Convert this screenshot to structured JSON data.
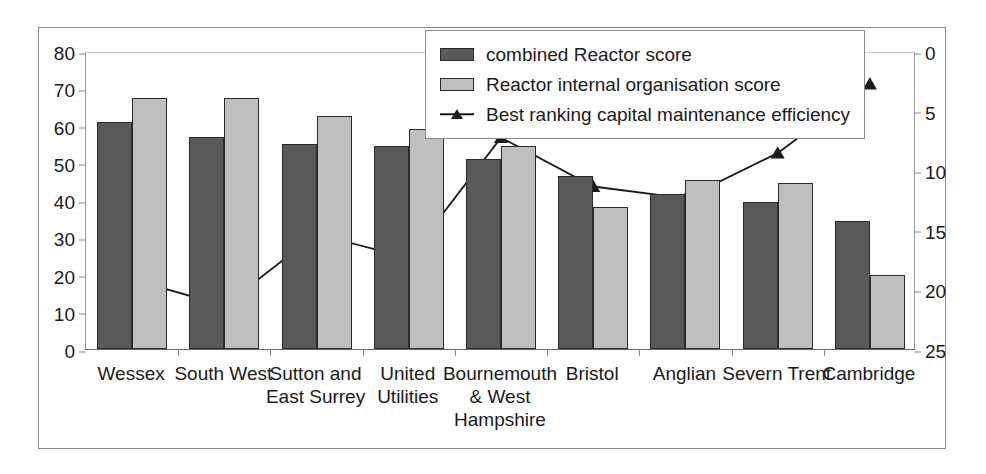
{
  "chart_data": {
    "type": "bar",
    "title": "",
    "subtitle": "",
    "xlabel": "",
    "ylabel": "",
    "categories": [
      "Wessex",
      "South West",
      "Sutton and\nEast Surrey",
      "United\nUtilities",
      "Bournemouth\n& West\nHampshire",
      "Bristol",
      "Anglian",
      "Severn Trent",
      "Cambridge"
    ],
    "series": [
      {
        "name": "combined Reactor score",
        "type": "bar",
        "axis": "left",
        "color": "#595959",
        "values": [
          61,
          57,
          55,
          54.5,
          51,
          46.5,
          41.5,
          39.5,
          34.5
        ]
      },
      {
        "name": "Reactor internal organisation score",
        "type": "bar",
        "axis": "left",
        "color": "#bfbfbf",
        "values": [
          67.5,
          67.5,
          62.5,
          59,
          54.5,
          38,
          45.5,
          44.5,
          20
        ]
      },
      {
        "name": "Best ranking capital maintenance efficiency",
        "type": "line",
        "axis": "right",
        "color": "#1a1a1a",
        "marker": "triangle",
        "values": [
          19,
          21.2,
          15.2,
          17.2,
          7.1,
          11.2,
          12.2,
          8.4,
          2.6
        ]
      }
    ],
    "left_axis": {
      "ticks": [
        0,
        10,
        20,
        30,
        40,
        50,
        60,
        70,
        80
      ],
      "ylim": [
        0,
        80
      ],
      "inverted": false
    },
    "right_axis": {
      "ticks": [
        0,
        5,
        10,
        15,
        20,
        25
      ],
      "ylim": [
        0,
        25
      ],
      "inverted": true
    },
    "grid": false,
    "legend_position": "top-center"
  },
  "legend": {
    "entries": [
      {
        "label": "combined Reactor score",
        "marker": "dark-swatch"
      },
      {
        "label": "Reactor internal organisation score",
        "marker": "light-swatch"
      },
      {
        "label": "Best ranking capital maintenance efficiency",
        "marker": "line-triangle"
      }
    ]
  },
  "colors": {
    "bar_dark": "#595959",
    "bar_light": "#bfbfbf",
    "line": "#1a1a1a",
    "frame": "#8a8a8a",
    "background": "#ffffff"
  }
}
